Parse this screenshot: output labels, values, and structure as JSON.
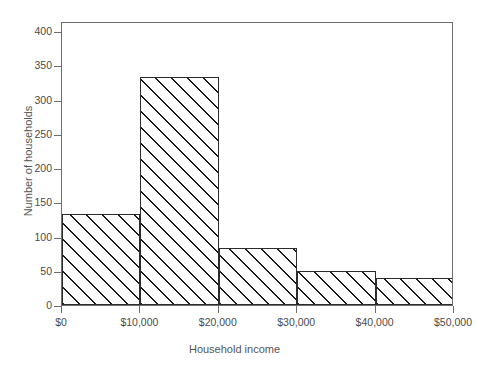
{
  "chart_data": {
    "type": "bar",
    "title": "",
    "subtitle": "",
    "xlabel": "Household income",
    "ylabel": "Number of households",
    "categories": [
      "$0-$10,000",
      "$10,000-$20,000",
      "$20,000-$30,000",
      "$30,000-$40,000",
      "$40,000-$50,000"
    ],
    "bin_edges": [
      0,
      10000,
      20000,
      30000,
      40000,
      50000
    ],
    "values": [
      133,
      333,
      84,
      49,
      40
    ],
    "xlim": [
      0,
      50000
    ],
    "ylim": [
      0,
      415
    ],
    "x_tick_labels": [
      "$0",
      "$10,000",
      "$20,000",
      "$30,000",
      "$40,000",
      "$50,000"
    ],
    "x_tick_values": [
      0,
      10000,
      20000,
      30000,
      40000,
      50000
    ],
    "y_tick_labels": [
      "0",
      "50",
      "100",
      "150",
      "200",
      "250",
      "300",
      "350",
      "400"
    ],
    "y_tick_values": [
      0,
      50,
      100,
      150,
      200,
      250,
      300,
      350,
      400
    ],
    "grid": false,
    "legend": null,
    "bar_fill": "diagonal-hatch",
    "bar_edge_color": "#2b2b2b",
    "axis_color": "#6d6d6d",
    "text_color": "#4a4a4a"
  },
  "axes": {
    "x_title": "Household income",
    "y_title": "Number of households"
  },
  "scan_artifact": ""
}
